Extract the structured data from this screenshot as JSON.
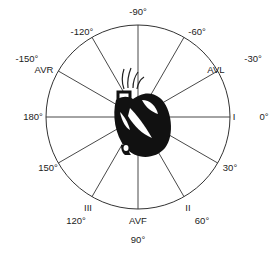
{
  "diagram": {
    "center": [
      138,
      117
    ],
    "radius": 92,
    "colors": {
      "line": "#333333",
      "heart": "#111111",
      "background": "#ffffff"
    },
    "spokes_deg": [
      0,
      30,
      60,
      90,
      120,
      150,
      180,
      -150,
      -120,
      -90,
      -60,
      -30
    ],
    "angle_labels": [
      {
        "text": "-90°",
        "x": 138,
        "y": 12
      },
      {
        "text": "-60°",
        "x": 197,
        "y": 32
      },
      {
        "text": "-120°",
        "x": 82,
        "y": 32
      },
      {
        "text": "-30°",
        "x": 253,
        "y": 59
      },
      {
        "text": "-150°",
        "x": 27,
        "y": 59
      },
      {
        "text": "0°",
        "x": 264,
        "y": 117
      },
      {
        "text": "180°",
        "x": 33,
        "y": 117
      },
      {
        "text": "30°",
        "x": 230,
        "y": 168
      },
      {
        "text": "150°",
        "x": 48,
        "y": 168
      },
      {
        "text": "60°",
        "x": 202,
        "y": 221
      },
      {
        "text": "120°",
        "x": 76,
        "y": 221
      },
      {
        "text": "90°",
        "x": 138,
        "y": 240
      }
    ],
    "lead_labels": [
      {
        "text": "AVL",
        "x": 216,
        "y": 70
      },
      {
        "text": "AVR",
        "x": 44,
        "y": 70
      },
      {
        "text": "I",
        "x": 234,
        "y": 117
      },
      {
        "text": "II",
        "x": 188,
        "y": 208
      },
      {
        "text": "III",
        "x": 88,
        "y": 208
      },
      {
        "text": "AVF",
        "x": 138,
        "y": 221
      }
    ]
  }
}
